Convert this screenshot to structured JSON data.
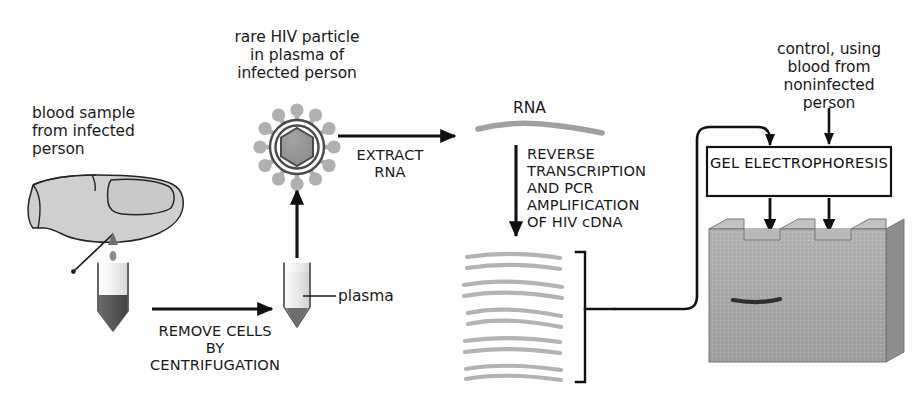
{
  "figure": {
    "background_color": "#ffffff",
    "ink_color": "#1a1a1a",
    "gel_color": "#a9a9a9",
    "strand_color": "#a0a0a0",
    "blood_color": "#5a5a5a",
    "plasma_color": "#d9d9d9",
    "skin_color": "#cfcfcf"
  },
  "labels": {
    "blood_sample": "blood sample\nfrom infected\nperson",
    "hiv_particle": "rare HIV particle\nin plasma of\ninfected person",
    "extract_rna": "EXTRACT\nRNA",
    "remove_cells": "REMOVE CELLS\nBY\nCENTRIFUGATION",
    "plasma": "plasma",
    "rna": "RNA",
    "reverse_transcription": "REVERSE\nTRANSCRIPTION\nAND PCR\nAMPLIFICATION\nOF HIV cDNA",
    "control": "control, using\nblood from\nnoninfected\nperson",
    "gel_electrophoresis": "GEL\nELECTROPHORESIS"
  },
  "diagram": {
    "steps": [
      "blood sample from infected person",
      "remove cells by centrifugation",
      "rare HIV particle in plasma of infected person",
      "extract RNA",
      "reverse transcription and PCR amplification of HIV cDNA",
      "gel electrophoresis"
    ],
    "hiv_particle": {
      "spike_count": 12,
      "capsid_shape": "hexagon",
      "envelope_rings": 2
    },
    "cdna_strands": {
      "pair_count": 5,
      "line_count": 10
    },
    "gel": {
      "well_count": 3,
      "band_count": 1,
      "band_lane": 1,
      "loading_arrows": 2
    }
  }
}
